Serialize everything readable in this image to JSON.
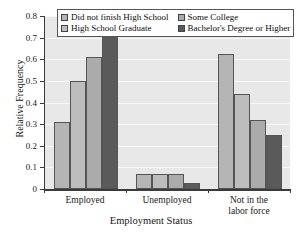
{
  "chart_data": {
    "type": "bar",
    "title": "",
    "xlabel": "Employment Status",
    "ylabel": "Relative Frequency",
    "categories": [
      "Employed",
      "Unemployed",
      "Not in the\nlabor force"
    ],
    "ylim": [
      0,
      0.8
    ],
    "ytick_labels": [
      "0",
      "0.1",
      "0.2",
      "0.3",
      "0.4",
      "0.5",
      "0.6",
      "0.7",
      "0.8"
    ],
    "ytick_values": [
      0,
      0.1,
      0.2,
      0.3,
      0.4,
      0.5,
      0.6,
      0.7,
      0.8
    ],
    "grid": true,
    "legend_position": "top",
    "series": [
      {
        "name": "Did not finish High School",
        "color": "#b5b5b5",
        "values": [
          0.31,
          0.07,
          0.625
        ]
      },
      {
        "name": "High School Graduate",
        "color": "#bdbdbd",
        "values": [
          0.5,
          0.07,
          0.44
        ]
      },
      {
        "name": "Some College",
        "color": "#ababab",
        "values": [
          0.61,
          0.07,
          0.32
        ]
      },
      {
        "name": "Bachelor's Degree or Higher",
        "color": "#5a5a5a",
        "values": [
          0.72,
          0.03,
          0.25
        ]
      }
    ]
  }
}
